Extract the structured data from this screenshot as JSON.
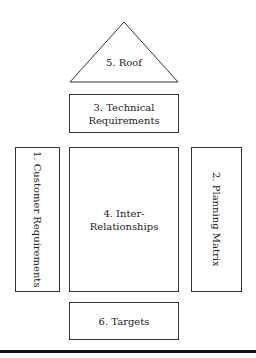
{
  "diagram": {
    "type": "house-of-quality",
    "roof": {
      "label": "5. Roof"
    },
    "technical": {
      "line1": "3. Technical",
      "line2": "Requirements"
    },
    "customer": {
      "label": "1. Customer Requirements"
    },
    "relationships": {
      "label": "4. Inter-Relationships"
    },
    "planning": {
      "label": "2. Planning Matrix"
    },
    "targets": {
      "label": "6. Targets"
    }
  }
}
